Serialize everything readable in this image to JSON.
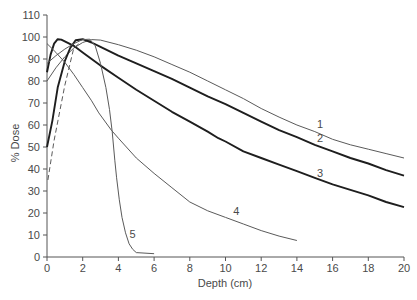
{
  "chart_data": {
    "type": "line",
    "title": "",
    "xlabel": "Depth (cm)",
    "ylabel": "% Dose",
    "xlim": [
      0,
      20
    ],
    "ylim": [
      0,
      110
    ],
    "xticks": [
      0,
      2,
      4,
      6,
      8,
      10,
      12,
      14,
      16,
      18,
      20
    ],
    "yticks": [
      0,
      10,
      20,
      30,
      40,
      50,
      60,
      70,
      80,
      90,
      100,
      110
    ],
    "grid": false,
    "legend": "none (curves labelled inline 1-5)",
    "colors": {
      "thin": "#5a5a5a",
      "thick": "#1e1e1e",
      "axis": "#555555",
      "text": "#4a4a4a"
    },
    "series": [
      {
        "name": "1",
        "style": "thin",
        "points": [
          [
            0,
            80
          ],
          [
            0.5,
            86
          ],
          [
            1,
            91
          ],
          [
            1.5,
            95
          ],
          [
            2,
            97.5
          ],
          [
            2.5,
            98.8
          ],
          [
            3,
            98.6
          ],
          [
            4,
            96.5
          ],
          [
            5,
            94
          ],
          [
            6,
            91
          ],
          [
            7,
            87.5
          ],
          [
            8,
            84
          ],
          [
            9,
            80
          ],
          [
            10,
            76
          ],
          [
            11,
            72
          ],
          [
            12,
            67.5
          ],
          [
            13,
            63.6
          ],
          [
            14,
            60
          ],
          [
            15,
            57
          ],
          [
            16,
            53.5
          ],
          [
            17,
            51
          ],
          [
            18,
            49
          ],
          [
            19,
            47
          ],
          [
            20,
            45
          ]
        ]
      },
      {
        "name": "2",
        "style": "thick",
        "points": [
          [
            0,
            50
          ],
          [
            0.3,
            62
          ],
          [
            0.6,
            77
          ],
          [
            1,
            89
          ],
          [
            1.3,
            95
          ],
          [
            1.6,
            98.5
          ],
          [
            2,
            99
          ],
          [
            2.5,
            97.5
          ],
          [
            3,
            95.5
          ],
          [
            4,
            91.5
          ],
          [
            5,
            88
          ],
          [
            6,
            84.5
          ],
          [
            7,
            81
          ],
          [
            8,
            77
          ],
          [
            9,
            73
          ],
          [
            10,
            69.5
          ],
          [
            11,
            65.5
          ],
          [
            12,
            61.5
          ],
          [
            13,
            57.7
          ],
          [
            14,
            54.5
          ],
          [
            15,
            51
          ],
          [
            16,
            48
          ],
          [
            17,
            45
          ],
          [
            18,
            42.5
          ],
          [
            19,
            39.5
          ],
          [
            20,
            37
          ]
        ]
      },
      {
        "name": "3",
        "style": "thick",
        "points": [
          [
            0,
            84
          ],
          [
            0.2,
            92
          ],
          [
            0.4,
            97
          ],
          [
            0.6,
            99
          ],
          [
            0.8,
            98.8
          ],
          [
            1,
            98
          ],
          [
            1.5,
            96
          ],
          [
            2,
            93
          ],
          [
            2.5,
            90
          ],
          [
            3,
            87
          ],
          [
            4,
            81.5
          ],
          [
            5,
            76
          ],
          [
            6,
            71
          ],
          [
            7,
            66
          ],
          [
            8,
            61.5
          ],
          [
            9,
            57
          ],
          [
            9.6,
            54
          ],
          [
            10,
            52.5
          ],
          [
            11,
            48
          ],
          [
            12,
            45
          ],
          [
            13,
            42
          ],
          [
            14,
            39
          ],
          [
            15,
            36
          ],
          [
            16,
            33
          ],
          [
            17,
            30.5
          ],
          [
            18,
            28
          ],
          [
            19,
            25
          ],
          [
            20,
            22.7
          ]
        ]
      },
      {
        "name": "4",
        "style": "thin",
        "points": [
          [
            0,
            97
          ],
          [
            0.5,
            93
          ],
          [
            1,
            88.5
          ],
          [
            1.5,
            83
          ],
          [
            2,
            77
          ],
          [
            2.5,
            71
          ],
          [
            2.9,
            65.5
          ],
          [
            3.6,
            57.7
          ],
          [
            4,
            54
          ],
          [
            5,
            45
          ],
          [
            6,
            38
          ],
          [
            7,
            31.5
          ],
          [
            8,
            25
          ],
          [
            9,
            21
          ],
          [
            10,
            18
          ],
          [
            11,
            15
          ],
          [
            12,
            12
          ],
          [
            13,
            9.5
          ],
          [
            14,
            7.5
          ]
        ]
      },
      {
        "name": "5",
        "style": "thin",
        "points": [
          [
            0,
            88
          ],
          [
            0.5,
            91.5
          ],
          [
            1,
            94.5
          ],
          [
            1.5,
            97
          ],
          [
            2,
            98.8
          ],
          [
            2.4,
            99
          ],
          [
            2.7,
            96
          ],
          [
            3,
            88
          ],
          [
            3.3,
            77
          ],
          [
            3.5,
            67
          ],
          [
            3.65,
            57
          ],
          [
            3.8,
            44
          ],
          [
            3.9,
            36
          ],
          [
            4.05,
            26
          ],
          [
            4.2,
            18
          ],
          [
            4.4,
            11
          ],
          [
            4.6,
            6
          ],
          [
            4.8,
            3.5
          ],
          [
            5,
            2
          ],
          [
            6,
            1.5
          ]
        ]
      },
      {
        "name": "dashed",
        "style": "dashed",
        "points": [
          [
            0.05,
            35
          ],
          [
            0.4,
            53
          ],
          [
            1,
            78
          ],
          [
            1.5,
            95
          ],
          [
            1.8,
            97
          ]
        ]
      }
    ],
    "annotations": [
      {
        "text": "1",
        "x": 15.3,
        "y": 58.6
      },
      {
        "text": "2",
        "x": 15.3,
        "y": 52.3
      },
      {
        "text": "3",
        "x": 15.3,
        "y": 36.4
      },
      {
        "text": "4",
        "x": 10.6,
        "y": 19.0
      },
      {
        "text": "5",
        "x": 4.8,
        "y": 8.6
      }
    ],
    "plot_box": {
      "x0": 47,
      "x1": 404,
      "y0": 257,
      "y1": 15
    }
  }
}
